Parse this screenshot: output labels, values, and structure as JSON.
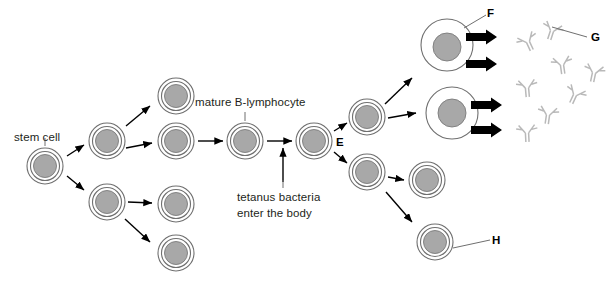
{
  "figure": {
    "background_color": "#ffffff",
    "width": 611,
    "height": 296
  },
  "labels": {
    "stem_cell": "stem cell",
    "mature_b_lymphocyte": "mature B-lymphocyte",
    "tetanus_line1": "tetanus bacteria",
    "tetanus_line2": "enter the body",
    "letter_e": "E",
    "letter_f": "F",
    "letter_g": "G",
    "letter_h": "H"
  },
  "colors": {
    "nucleus_fill": "#a8a8a8",
    "cell_outline": "#6f6f6f",
    "antibody": "#b9b9b9",
    "arrow": "#000000",
    "text": "#231f20"
  },
  "cells": [
    {
      "id": "stem-cell",
      "cx": 45,
      "cy": 166,
      "r": 18,
      "type": "lymphocyte"
    },
    {
      "id": "cell-gen1-upper",
      "cx": 107,
      "cy": 141,
      "r": 18,
      "type": "lymphocyte"
    },
    {
      "id": "cell-gen1-lower",
      "cx": 107,
      "cy": 202,
      "r": 18,
      "type": "lymphocyte"
    },
    {
      "id": "cell-gen2-top",
      "cx": 176,
      "cy": 96,
      "r": 18,
      "type": "lymphocyte"
    },
    {
      "id": "cell-gen2-mid",
      "cx": 176,
      "cy": 141,
      "r": 18,
      "type": "lymphocyte"
    },
    {
      "id": "cell-gen2-low",
      "cx": 176,
      "cy": 204,
      "r": 18,
      "type": "lymphocyte"
    },
    {
      "id": "cell-gen2-bottom",
      "cx": 176,
      "cy": 253,
      "r": 18,
      "type": "lymphocyte"
    },
    {
      "id": "mature-b-cell",
      "cx": 245,
      "cy": 141,
      "r": 18,
      "type": "lymphocyte"
    },
    {
      "id": "activated-b-cell",
      "cx": 314,
      "cy": 141,
      "r": 18,
      "type": "lymphocyte"
    },
    {
      "id": "daughter-upper",
      "cx": 367,
      "cy": 117,
      "r": 18,
      "type": "lymphocyte"
    },
    {
      "id": "daughter-lower",
      "cx": 367,
      "cy": 172,
      "r": 18,
      "type": "lymphocyte"
    },
    {
      "id": "memory-cell-upper",
      "cx": 427,
      "cy": 180,
      "r": 18,
      "type": "lymphocyte"
    },
    {
      "id": "memory-cell-lower",
      "cx": 435,
      "cy": 242,
      "r": 18,
      "type": "lymphocyte"
    },
    {
      "id": "plasma-cell-upper",
      "cx": 447,
      "cy": 45,
      "r": 26,
      "type": "plasma"
    },
    {
      "id": "plasma-cell-lower",
      "cx": 452,
      "cy": 113,
      "r": 26,
      "type": "plasma"
    }
  ],
  "antibodies": [
    {
      "id": "antibody-1",
      "cx": 528,
      "cy": 42,
      "rot": -25
    },
    {
      "id": "antibody-2",
      "cx": 552,
      "cy": 31,
      "rot": 18
    },
    {
      "id": "antibody-3",
      "cx": 562,
      "cy": 65,
      "rot": -8
    },
    {
      "id": "antibody-4",
      "cx": 594,
      "cy": 73,
      "rot": 12
    },
    {
      "id": "antibody-5",
      "cx": 527,
      "cy": 88,
      "rot": -5
    },
    {
      "id": "antibody-6",
      "cx": 575,
      "cy": 95,
      "rot": 25
    },
    {
      "id": "antibody-7",
      "cx": 527,
      "cy": 133,
      "rot": -3
    },
    {
      "id": "antibody-8",
      "cx": 548,
      "cy": 115,
      "rot": 8
    }
  ],
  "secretion_arrows": [
    {
      "id": "secretion-arrow-1",
      "x": 468,
      "y": 37
    },
    {
      "id": "secretion-arrow-2",
      "x": 468,
      "y": 64
    },
    {
      "id": "secretion-arrow-3",
      "x": 473,
      "y": 105
    },
    {
      "id": "secretion-arrow-4",
      "x": 473,
      "y": 130
    }
  ]
}
